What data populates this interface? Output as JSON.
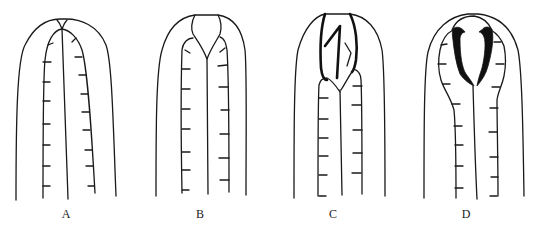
{
  "figure": {
    "panels": [
      {
        "id": "A",
        "label": "A",
        "label_x": 66,
        "label_y": 210
      },
      {
        "id": "B",
        "label": "B",
        "label_x": 200,
        "label_y": 210
      },
      {
        "id": "C",
        "label": "C",
        "label_x": 333,
        "label_y": 210
      },
      {
        "id": "D",
        "label": "D",
        "label_x": 466,
        "label_y": 210
      }
    ],
    "colors": {
      "line": "#1a1a1a",
      "background": "#ffffff"
    }
  }
}
